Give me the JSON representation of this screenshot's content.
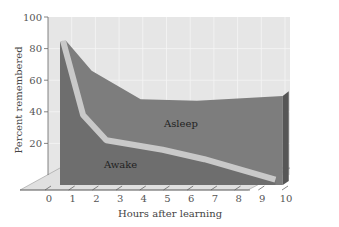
{
  "chart_data": {
    "type": "area",
    "title": "",
    "xlabel": "Hours after learning",
    "ylabel": "Percent remembered",
    "x_ticks": [
      "0",
      "1",
      "2",
      "3",
      "4",
      "5",
      "6",
      "7",
      "8",
      "9",
      "10"
    ],
    "y_ticks": [
      "20",
      "40",
      "60",
      "80",
      "100"
    ],
    "xlim": [
      0,
      10
    ],
    "ylim": [
      0,
      100
    ],
    "grid": true,
    "legend": "none (inline area labels)",
    "series": [
      {
        "name": "Asleep",
        "x": [
          0.5,
          1,
          2,
          4,
          8
        ],
        "values": [
          85,
          68,
          48,
          47,
          50
        ]
      },
      {
        "name": "Awake",
        "x": [
          0.5,
          1,
          2,
          4,
          5,
          8
        ],
        "values": [
          85,
          38,
          22,
          17,
          12,
          2
        ]
      }
    ],
    "annotations": [
      "Asleep",
      "Awake"
    ],
    "colors": {
      "asleep_area": "#7f7f7f",
      "awake_area": "#6f6f6f",
      "band": "#c8c8c8",
      "back_wall": "#e6e6e6",
      "grid": "#f4f4f4",
      "floor": "#dcdcdc",
      "side": "#555555"
    }
  }
}
